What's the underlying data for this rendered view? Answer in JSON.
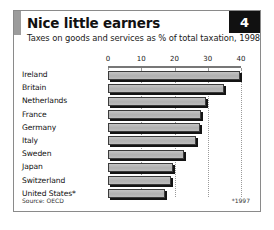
{
  "header": {
    "title": "Nice little earners",
    "subtitle": "Taxes on goods and services as % of total taxation, 1998",
    "badge_number": "4"
  },
  "footer": {
    "source": "Source: OECD",
    "footnote": "*1997"
  },
  "colors": {
    "bar_fill": "#b6b6b6",
    "bar_outline": "#3b3b3b",
    "bar_shadow": "#141414",
    "badge_background": "#111111",
    "badge_text": "#ffffff",
    "accent_bar": "#9c9c9c",
    "frame_border": "#8a8a8a",
    "gridline": "#9a9a9a"
  },
  "chart_data": {
    "type": "bar",
    "orientation": "horizontal",
    "title": "Nice little earners",
    "subtitle": "Taxes on goods and services as % of total taxation, 1998",
    "xlabel": "",
    "ylabel": "",
    "xlim": [
      0,
      40
    ],
    "ticks": [
      0,
      10,
      20,
      30,
      40
    ],
    "tick_labels": [
      "0",
      "10",
      "20",
      "30",
      "40"
    ],
    "grid": true,
    "grid_axis": "x",
    "legend": false,
    "source": "Source: OECD",
    "footnote": "*1997",
    "categories": [
      "Ireland",
      "Britain",
      "Netherlands",
      "France",
      "Germany",
      "Italy",
      "Sweden",
      "Japan",
      "Switzerland",
      "United States*"
    ],
    "values": [
      39.8,
      35.0,
      29.5,
      28.0,
      27.8,
      26.5,
      23.0,
      19.5,
      18.8,
      17.0
    ]
  }
}
